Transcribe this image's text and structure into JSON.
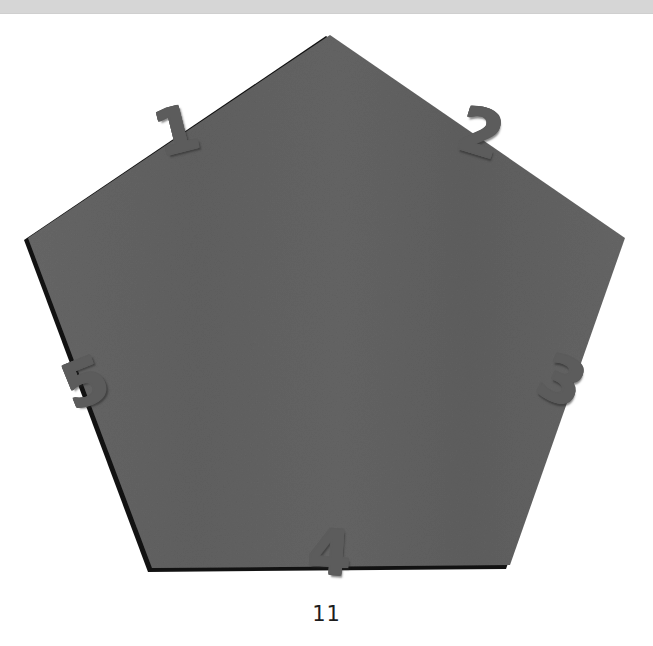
{
  "window": {
    "top_bar_color": "#d6d6d6"
  },
  "figure": {
    "background_color": "#ffffff",
    "shape": {
      "name": "pentagon",
      "sides": 5,
      "fill_color": "#626262",
      "edge_shadow_color": "#111111",
      "vertices": [
        [
          330,
          21
        ],
        [
          625,
          224
        ],
        [
          510,
          551
        ],
        [
          152,
          554
        ],
        [
          28,
          224
        ]
      ]
    },
    "edge_labels": [
      {
        "id": "1",
        "text": "1",
        "edge": "upper-left",
        "rotation_deg": -14
      },
      {
        "id": "2",
        "text": "2",
        "edge": "upper-right",
        "rotation_deg": 17
      },
      {
        "id": "3",
        "text": "3",
        "edge": "right",
        "rotation_deg": 25
      },
      {
        "id": "4",
        "text": "4",
        "edge": "bottom",
        "rotation_deg": 4
      },
      {
        "id": "5",
        "text": "5",
        "edge": "left",
        "rotation_deg": -22
      }
    ],
    "label_style": {
      "fill_color": "#e8e8e8",
      "outline_color": "#5c5c5c"
    },
    "caption": "11"
  }
}
